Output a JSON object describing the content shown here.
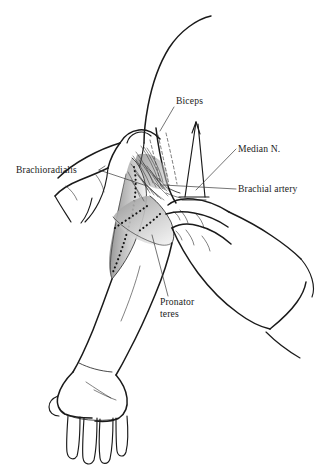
{
  "figure": {
    "style": "black-and-white line drawing with gray shading",
    "background_color": "#ffffff",
    "ink_color": "#1a1a1a",
    "shading_color": "#b9b9b9"
  },
  "labels": [
    {
      "id": "biceps",
      "text": "Biceps",
      "lines": [
        "Biceps"
      ],
      "x": 176,
      "y": 104,
      "anchor": "start",
      "leader": "M 174 107 L 160 131"
    },
    {
      "id": "median-nerve",
      "text": "Median N.",
      "lines": [
        "Median N."
      ],
      "x": 238,
      "y": 152,
      "anchor": "start",
      "leader": "M 236 149 L 196 190"
    },
    {
      "id": "brachial-artery",
      "text": "Brachial artery",
      "lines": [
        "Brachial artery"
      ],
      "x": 238,
      "y": 192,
      "anchor": "start",
      "leader": "M 236 189 L 163 185"
    },
    {
      "id": "brachioradialis",
      "text": "Brachioradialis",
      "lines": [
        "Brachioradialis"
      ],
      "x": 16,
      "y": 173,
      "anchor": "start",
      "leader": "M 99 170 L 147 186"
    },
    {
      "id": "pronator-teres",
      "text": "Pronator teres",
      "lines": [
        "Pronator",
        "teres"
      ],
      "x": 160,
      "y": 305,
      "anchor": "start",
      "leader": "M 168 296 L 152 235"
    }
  ],
  "structures": [
    {
      "id": "upper-arm",
      "name": "Patient upper arm"
    },
    {
      "id": "forearm",
      "name": "Patient forearm"
    },
    {
      "id": "patient-hand",
      "name": "Patient hand, relaxed"
    },
    {
      "id": "examiner-left-hand",
      "name": "Examiner left hand with thumb"
    },
    {
      "id": "examiner-right-hand",
      "name": "Examiner right hand palpating"
    },
    {
      "id": "brachioradialis-muscle",
      "name": "Brachioradialis muscle belly, shaded"
    },
    {
      "id": "pronator-teres-muscle",
      "name": "Pronator teres muscle belly, shaded"
    },
    {
      "id": "biceps-tendon",
      "name": "Biceps tendon retractor"
    },
    {
      "id": "fiber-fan",
      "name": "Bicipital aponeurosis fibers"
    }
  ]
}
